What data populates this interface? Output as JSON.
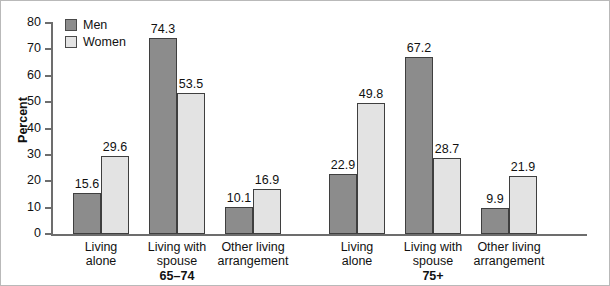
{
  "chart_data": {
    "type": "bar",
    "title": "",
    "subtitle": "",
    "xlabel": "",
    "ylabel": "Percent",
    "ylim": [
      0,
      80
    ],
    "ytick_values": [
      0,
      10,
      20,
      30,
      40,
      50,
      60,
      70,
      80
    ],
    "ytick_labels": [
      "0",
      "10",
      "20",
      "30",
      "40",
      "50",
      "60",
      "70",
      "80"
    ],
    "grid": false,
    "legend_position": "top-left",
    "legend": [
      "Men",
      "Women"
    ],
    "colors": {
      "men": "#8c8c8c",
      "women": "#e3e3e3",
      "bar_outline": "#3f3f3f",
      "axis": "#6d6d6d",
      "text": "#111111",
      "background": "#ffffff",
      "frame": "#b9b9b9"
    },
    "groups": [
      {
        "name": "65–74",
        "categories": [
          "Living\nalone",
          "Living with\nspouse",
          "Other living\narrangement"
        ],
        "series": [
          {
            "name": "Men",
            "values": [
              15.6,
              74.3,
              10.1
            ]
          },
          {
            "name": "Women",
            "values": [
              29.6,
              53.5,
              16.9
            ]
          }
        ]
      },
      {
        "name": "75+",
        "categories": [
          "Living\nalone",
          "Living with\nspouse",
          "Other living\narrangement"
        ],
        "series": [
          {
            "name": "Men",
            "values": [
              22.9,
              67.2,
              9.9
            ]
          },
          {
            "name": "Women",
            "values": [
              49.8,
              28.7,
              21.9
            ]
          }
        ]
      }
    ],
    "categories": [
      "65-74 Living alone",
      "65-74 Living with spouse",
      "65-74 Other living arrangement",
      "75+ Living alone",
      "75+ Living with spouse",
      "75+ Other living arrangement"
    ],
    "series": [
      {
        "name": "Men",
        "values": [
          15.6,
          74.3,
          10.1,
          22.9,
          67.2,
          9.9
        ]
      },
      {
        "name": "Women",
        "values": [
          29.6,
          53.5,
          16.9,
          49.8,
          28.7,
          21.9
        ]
      }
    ],
    "value_labels": [
      "15.6",
      "29.6",
      "74.3",
      "53.5",
      "10.1",
      "16.9",
      "22.9",
      "49.8",
      "67.2",
      "28.7",
      "9.9",
      "21.9"
    ]
  }
}
